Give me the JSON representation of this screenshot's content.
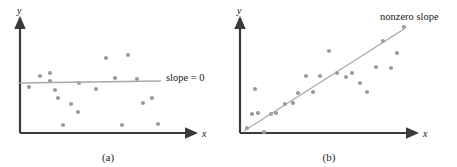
{
  "figure": {
    "background": "#ffffff",
    "axis_color": "#3b3b3b",
    "point_color": "#9a9a9a",
    "line_color": "#a8a8a8",
    "text_color": "#1a1a1a"
  },
  "panels": [
    {
      "key": "a",
      "caption": "(a)",
      "x_axis_label": "x",
      "y_axis_label": "y",
      "annotation": "slope = 0",
      "origin": {
        "x": 20,
        "y": 133
      },
      "x_axis_end": {
        "x": 196,
        "y": 133
      },
      "y_axis_end": {
        "x": 20,
        "y": 18
      },
      "fit_line": {
        "x1": 18,
        "y1": 83,
        "x2": 161,
        "y2": 81
      },
      "annotation_pos": {
        "x": 166,
        "y": 74
      },
      "caption_pos": {
        "x": 108,
        "y": 161
      },
      "x_label_pos": {
        "x": 202,
        "y": 137
      },
      "y_label_pos": {
        "x": 17,
        "y": 14
      },
      "points": [
        {
          "x": 29,
          "y": 87
        },
        {
          "x": 40,
          "y": 76
        },
        {
          "x": 50,
          "y": 81
        },
        {
          "x": 55,
          "y": 90
        },
        {
          "x": 50,
          "y": 73
        },
        {
          "x": 58,
          "y": 98
        },
        {
          "x": 63,
          "y": 125
        },
        {
          "x": 71,
          "y": 104
        },
        {
          "x": 78,
          "y": 112
        },
        {
          "x": 79,
          "y": 83
        },
        {
          "x": 96,
          "y": 89
        },
        {
          "x": 106,
          "y": 58
        },
        {
          "x": 115,
          "y": 78
        },
        {
          "x": 122,
          "y": 125
        },
        {
          "x": 128,
          "y": 55
        },
        {
          "x": 137,
          "y": 79
        },
        {
          "x": 143,
          "y": 103
        },
        {
          "x": 152,
          "y": 98
        },
        {
          "x": 158,
          "y": 124
        }
      ]
    },
    {
      "key": "b",
      "caption": "(b)",
      "x_axis_label": "x",
      "y_axis_label": "y",
      "annotation": "nonzero slope",
      "origin": {
        "x": 240,
        "y": 133
      },
      "x_axis_end": {
        "x": 417,
        "y": 133
      },
      "y_axis_end": {
        "x": 240,
        "y": 18
      },
      "fit_line": {
        "x1": 244,
        "y1": 131,
        "x2": 404,
        "y2": 29
      },
      "annotation_pos": {
        "x": 380,
        "y": 13
      },
      "caption_pos": {
        "x": 329,
        "y": 161
      },
      "x_label_pos": {
        "x": 423,
        "y": 137
      },
      "y_label_pos": {
        "x": 237,
        "y": 14
      },
      "points": [
        {
          "x": 247,
          "y": 128
        },
        {
          "x": 252,
          "y": 114
        },
        {
          "x": 258,
          "y": 113
        },
        {
          "x": 264,
          "y": 132
        },
        {
          "x": 255,
          "y": 89
        },
        {
          "x": 271,
          "y": 114
        },
        {
          "x": 276,
          "y": 113
        },
        {
          "x": 285,
          "y": 104
        },
        {
          "x": 293,
          "y": 103
        },
        {
          "x": 298,
          "y": 93
        },
        {
          "x": 306,
          "y": 76
        },
        {
          "x": 313,
          "y": 92
        },
        {
          "x": 320,
          "y": 76
        },
        {
          "x": 329,
          "y": 51
        },
        {
          "x": 337,
          "y": 73
        },
        {
          "x": 346,
          "y": 77
        },
        {
          "x": 352,
          "y": 73
        },
        {
          "x": 360,
          "y": 83
        },
        {
          "x": 367,
          "y": 92
        },
        {
          "x": 376,
          "y": 67
        },
        {
          "x": 383,
          "y": 41
        },
        {
          "x": 391,
          "y": 68
        },
        {
          "x": 397,
          "y": 53
        },
        {
          "x": 404,
          "y": 27
        }
      ]
    }
  ]
}
